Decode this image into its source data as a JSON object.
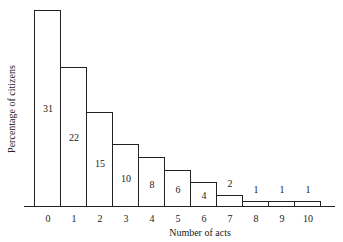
{
  "chart_data": {
    "type": "bar",
    "title": "",
    "xlabel": "Number of acts",
    "ylabel": "Percentage of citizens",
    "categories": [
      "0",
      "1",
      "2",
      "3",
      "4",
      "5",
      "6",
      "7",
      "8",
      "9",
      "10"
    ],
    "values": [
      31,
      22,
      15,
      10,
      8,
      6,
      4,
      2,
      1,
      1,
      1
    ],
    "ylim": [
      0,
      31
    ],
    "grid": false,
    "legend": null,
    "bar_style": "outlined histogram, white fill, black border, value labels inside bars (above for 8-10)"
  },
  "layout": {
    "baseline_y": 207,
    "bar_left": 34,
    "bar_width": 26,
    "bar_tops": [
      10,
      67,
      112,
      144,
      157,
      170,
      182,
      195,
      201,
      201,
      201
    ]
  }
}
